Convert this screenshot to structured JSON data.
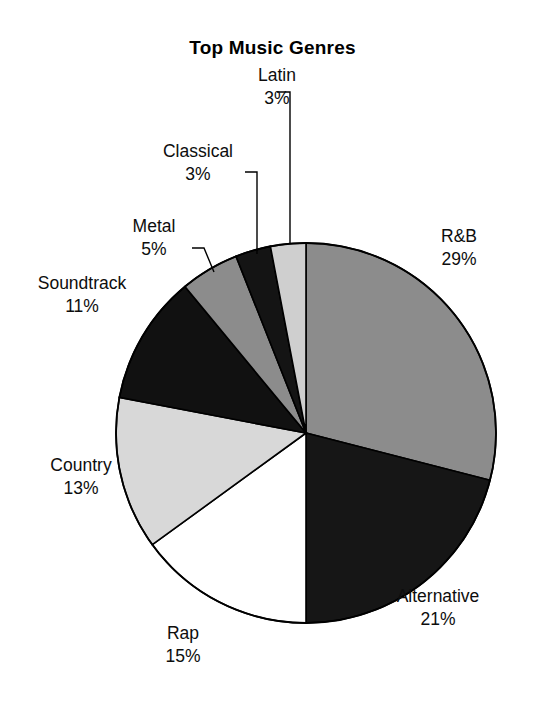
{
  "chart_data": {
    "type": "pie",
    "title": "Top Music Genres",
    "xlabel": "",
    "ylabel": "",
    "legend": "none",
    "grid": false,
    "units": "percent",
    "start_angle_deg": 0,
    "direction": "clockwise",
    "categories": [
      "R&B",
      "Alternative",
      "Rap",
      "Country",
      "Soundtrack",
      "Metal",
      "Classical",
      "Latin"
    ],
    "values": [
      29,
      21,
      15,
      13,
      11,
      5,
      3,
      3
    ],
    "value_labels": [
      "29%",
      "21%",
      "15%",
      "13%",
      "11%",
      "5%",
      "3%",
      "3%"
    ],
    "slices": [
      {
        "name": "R&B",
        "value": 29,
        "value_label": "29%",
        "fill": "#8c8c8c",
        "label_align": "left"
      },
      {
        "name": "Alternative",
        "value": 21,
        "value_label": "21%",
        "fill": "#161616",
        "label_align": "left"
      },
      {
        "name": "Rap",
        "value": 15,
        "value_label": "15%",
        "fill": "#ffffff",
        "label_align": "center"
      },
      {
        "name": "Country",
        "value": 13,
        "value_label": "13%",
        "fill": "#d8d8d8",
        "label_align": "center"
      },
      {
        "name": "Soundtrack",
        "value": 11,
        "value_label": "11%",
        "fill": "#111111",
        "label_align": "center"
      },
      {
        "name": "Metal",
        "value": 5,
        "value_label": "5%",
        "fill": "#8c8c8c",
        "label_align": "center"
      },
      {
        "name": "Classical",
        "value": 3,
        "value_label": "3%",
        "fill": "#141414",
        "label_align": "center"
      },
      {
        "name": "Latin",
        "value": 3,
        "value_label": "3%",
        "fill": "#cfcfcf",
        "label_align": "center"
      }
    ],
    "geometry": {
      "center_x": 306,
      "center_y": 433,
      "radius": 190,
      "outline_color": "#000000",
      "background": "#ffffff"
    }
  },
  "title": {
    "text": "Top Music Genres"
  },
  "labels": {
    "latin": {
      "name": "Latin",
      "value": "3%"
    },
    "classical": {
      "name": "Classical",
      "value": "3%"
    },
    "metal": {
      "name": "Metal",
      "value": "5%"
    },
    "soundtrack": {
      "name": "Soundtrack",
      "value": "11%"
    },
    "country": {
      "name": "Country",
      "value": "13%"
    },
    "rap": {
      "name": "Rap",
      "value": "15%"
    },
    "alternative": {
      "name": "Alternative",
      "value": "21%"
    },
    "rnb": {
      "name": "R&B",
      "value": "29%"
    }
  }
}
